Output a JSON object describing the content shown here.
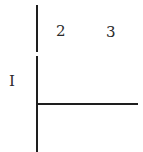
{
  "diagram": {
    "labels": {
      "left": "I",
      "top_left": "2",
      "top_right": "3"
    },
    "colors": {
      "line": "#1e1e1e",
      "text": "#2a2a2a",
      "background": "#ffffff"
    }
  }
}
